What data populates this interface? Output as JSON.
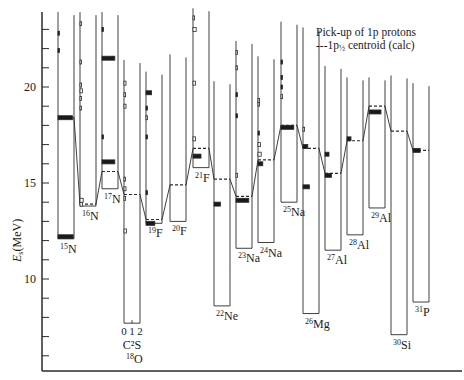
{
  "chart_data": {
    "type": "bar",
    "title": "",
    "xlabel": "",
    "ylabel": "E_s (MeV)",
    "ylim": [
      6,
      24.5
    ],
    "yticks_major": [
      10,
      15,
      20
    ],
    "yticks_minor_step": 1,
    "grid": false,
    "legend": {
      "position": "upper right",
      "entries": [
        "Pick-up of 1p protons",
        "1p½ centroid (calc)"
      ]
    },
    "bar_scale_label": "C²S",
    "bar_scale_ticks": [
      "0",
      "1",
      "2"
    ],
    "nuclei": [
      {
        "label": "15N",
        "mass": "15",
        "symbol": "N",
        "x": 58,
        "threshold": 12.1,
        "centroid": 18.4,
        "strengths": [
          {
            "E": 12.2,
            "C2S": 1.9
          },
          {
            "E": 18.4,
            "C2S": 1.8
          },
          {
            "E": 21.9,
            "C2S": 0.1
          },
          {
            "E": 22.8,
            "C2S": 0.1
          }
        ]
      },
      {
        "label": "16N",
        "mass": "16",
        "symbol": "N",
        "x": 80,
        "threshold": 13.8,
        "centroid": 13.9,
        "strengths": [
          {
            "E": 13.9,
            "C2S": 0.3
          },
          {
            "E": 14.1,
            "C2S": 0.4
          },
          {
            "E": 18.9,
            "C2S": 0.05
          },
          {
            "E": 19.4,
            "C2S": 0.1
          },
          {
            "E": 19.8,
            "C2S": 0.3
          },
          {
            "E": 20.1,
            "C2S": 0.2
          },
          {
            "E": 21.3,
            "C2S": 0.05
          },
          {
            "E": 23.3,
            "C2S": 0.05
          }
        ]
      },
      {
        "label": "17N",
        "mass": "17",
        "symbol": "N",
        "x": 102,
        "threshold": 14.7,
        "centroid": 15.6,
        "strengths": [
          {
            "E": 16.1,
            "C2S": 1.6
          },
          {
            "E": 17.4,
            "C2S": 0.1
          },
          {
            "E": 21.5,
            "C2S": 1.6
          },
          {
            "E": 23.0,
            "C2S": 0.1
          }
        ]
      },
      {
        "label": "18O",
        "mass": "18",
        "symbol": "O",
        "x": 124,
        "threshold": 7.7,
        "centroid": 14.4,
        "strengths": [
          {
            "E": 12.5,
            "C2S": 0.3
          },
          {
            "E": 14.2,
            "C2S": 0.2
          },
          {
            "E": 14.7,
            "C2S": 0.25
          },
          {
            "E": 15.2,
            "C2S": 0.1
          },
          {
            "E": 19.0,
            "C2S": 0.25
          },
          {
            "E": 19.6,
            "C2S": 0.2
          },
          {
            "E": 20.2,
            "C2S": 0.25
          }
        ]
      },
      {
        "label": "19F",
        "mass": "19",
        "symbol": "F",
        "x": 146,
        "threshold": 12.9,
        "centroid": 13.1,
        "strengths": [
          {
            "E": 12.9,
            "C2S": 1.1
          },
          {
            "E": 14.5,
            "C2S": 0.1
          },
          {
            "E": 17.4,
            "C2S": 0.15
          },
          {
            "E": 18.4,
            "C2S": 0.05
          },
          {
            "E": 18.9,
            "C2S": 0.1
          },
          {
            "E": 19.7,
            "C2S": 0.7
          }
        ]
      },
      {
        "label": "20F",
        "mass": "20",
        "symbol": "F",
        "x": 170,
        "threshold": 13.0,
        "centroid": 14.9,
        "strengths": []
      },
      {
        "label": "21F",
        "mass": "21",
        "symbol": "F",
        "x": 193,
        "threshold": 15.8,
        "centroid": 16.8,
        "strengths": [
          {
            "E": 16.4,
            "C2S": 1.0
          },
          {
            "E": 17.3,
            "C2S": 0.3
          },
          {
            "E": 20.2,
            "C2S": 0.3
          },
          {
            "E": 23.0,
            "C2S": 0.4
          },
          {
            "E": 23.6,
            "C2S": 0.2
          }
        ]
      },
      {
        "label": "22Ne",
        "mass": "22",
        "symbol": "Ne",
        "x": 214,
        "threshold": 8.6,
        "centroid": 15.2,
        "strengths": [
          {
            "E": 13.9,
            "C2S": 0.8
          }
        ]
      },
      {
        "label": "23Na",
        "mass": "23",
        "symbol": "Na",
        "x": 236,
        "threshold": 11.6,
        "centroid": 14.3,
        "strengths": [
          {
            "E": 14.1,
            "C2S": 1.6
          },
          {
            "E": 15.4,
            "C2S": 0.2
          },
          {
            "E": 18.5,
            "C2S": 0.1
          },
          {
            "E": 19.6,
            "C2S": 0.1
          },
          {
            "E": 21.0,
            "C2S": 0.05
          },
          {
            "E": 21.8,
            "C2S": 0.05
          }
        ]
      },
      {
        "label": "24Na",
        "mass": "24",
        "symbol": "Na",
        "x": 258,
        "threshold": 11.9,
        "centroid": 16.2,
        "strengths": [
          {
            "E": 16.0,
            "C2S": 0.6
          },
          {
            "E": 16.5,
            "C2S": 0.4
          },
          {
            "E": 17.0,
            "C2S": 0.3
          },
          {
            "E": 17.6,
            "C2S": 0.1
          },
          {
            "E": 19.1,
            "C2S": 0.05
          },
          {
            "E": 19.3,
            "C2S": 0.2
          }
        ]
      },
      {
        "label": "25Na",
        "mass": "25",
        "symbol": "Na",
        "x": 281,
        "threshold": 14.0,
        "centroid": 18.0,
        "strengths": [
          {
            "E": 17.9,
            "C2S": 1.6
          },
          {
            "E": 19.5,
            "C2S": 0.2
          },
          {
            "E": 20.0,
            "C2S": 0.1
          },
          {
            "E": 20.5,
            "C2S": 0.1
          },
          {
            "E": 21.3,
            "C2S": 0.1
          }
        ]
      },
      {
        "label": "26Mg",
        "mass": "26",
        "symbol": "Mg",
        "x": 303,
        "threshold": 8.2,
        "centroid": 16.8,
        "strengths": [
          {
            "E": 14.8,
            "C2S": 0.8
          },
          {
            "E": 16.9,
            "C2S": 0.6
          },
          {
            "E": 17.8,
            "C2S": 0.2
          }
        ]
      },
      {
        "label": "27Al",
        "mass": "27",
        "symbol": "Al",
        "x": 325,
        "threshold": 11.5,
        "centroid": 15.5,
        "strengths": [
          {
            "E": 15.4,
            "C2S": 0.8
          },
          {
            "E": 16.5,
            "C2S": 0.5
          }
        ]
      },
      {
        "label": "28Al",
        "mass": "28",
        "symbol": "Al",
        "x": 347,
        "threshold": 12.3,
        "centroid": 17.2,
        "strengths": [
          {
            "E": 17.3,
            "C2S": 0.5
          }
        ]
      },
      {
        "label": "29Al",
        "mass": "29",
        "symbol": "Al",
        "x": 369,
        "threshold": 13.7,
        "centroid": 19.0,
        "strengths": [
          {
            "E": 18.7,
            "C2S": 1.5
          }
        ]
      },
      {
        "label": "30Si",
        "mass": "30",
        "symbol": "Si",
        "x": 391,
        "threshold": 7.1,
        "centroid": 17.7,
        "strengths": []
      },
      {
        "label": "31P",
        "mass": "31",
        "symbol": "P",
        "x": 413,
        "threshold": 8.8,
        "centroid": 16.7,
        "strengths": [
          {
            "E": 16.7,
            "C2S": 0.9
          }
        ]
      }
    ]
  },
  "legend": {
    "line1": "Pick-up of 1p protons",
    "line2_prefix": "---1p",
    "line2_sub": "½",
    "line2_suffix": " centroid (calc)"
  },
  "axis": {
    "ylabel_var": "E",
    "ylabel_sub": "s",
    "ylabel_unit": "(MeV)",
    "tick_labels": [
      "10",
      "15",
      "20"
    ],
    "cs_label": "C²S",
    "cs_ticks": [
      "0",
      "1",
      "2"
    ]
  }
}
